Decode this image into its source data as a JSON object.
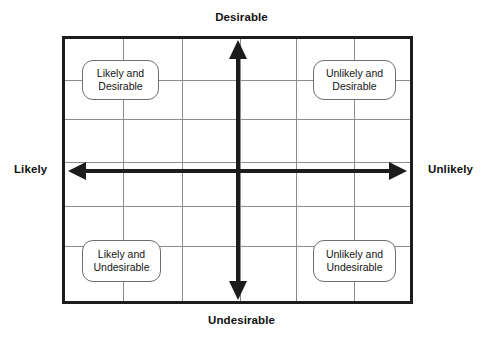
{
  "diagram": {
    "title_visible": false,
    "type": "2x2-likelihood-desirability-matrix",
    "axes": {
      "top_label": "Desirable",
      "bottom_label": "Undesirable",
      "left_label": "Likely",
      "right_label": "Unlikely"
    },
    "grid": {
      "columns": 6,
      "rows": 5,
      "vertical_positions_px": [
        61,
        120,
        178,
        234,
        292,
        350
      ],
      "horizontal_positions_px": [
        44,
        83,
        126,
        170,
        210
      ],
      "line_color": "#8c8c8c",
      "frame_color": "#1c1c1c",
      "background_color": "#ffffff"
    },
    "arrows": {
      "color": "#1c1c1c",
      "horizontal": {
        "direction": "double",
        "from": "Likely",
        "to": "Unlikely"
      },
      "vertical": {
        "direction": "double",
        "from": "Undesirable",
        "to": "Desirable"
      }
    },
    "quadrants": [
      {
        "id": "likely-desirable",
        "line1": "Likely and",
        "line2": "Desirable",
        "position": "top-left"
      },
      {
        "id": "unlikely-desirable",
        "line1": "Unlikely and",
        "line2": "Desirable",
        "position": "top-right"
      },
      {
        "id": "likely-undesirable",
        "line1": "Likely and",
        "line2": "Undesirable",
        "position": "bottom-left"
      },
      {
        "id": "unlikely-undesirable",
        "line1": "Unlikely and",
        "line2": "Undesirable",
        "position": "bottom-right"
      }
    ]
  }
}
